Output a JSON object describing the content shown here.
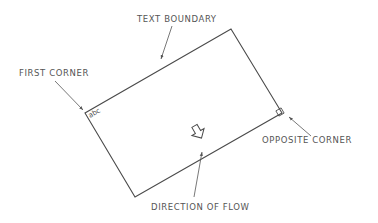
{
  "diagram": {
    "labels": {
      "text_boundary": "TEXT BOUNDARY",
      "first_corner": "FIRST CORNER",
      "opposite_corner": "OPPOSITE CORNER",
      "direction_of_flow": "DIRECTION OF FLOW"
    },
    "sample_text": "abc",
    "colors": {
      "line": "#4a4a4a",
      "text": "#555555",
      "background": "#ffffff"
    }
  }
}
